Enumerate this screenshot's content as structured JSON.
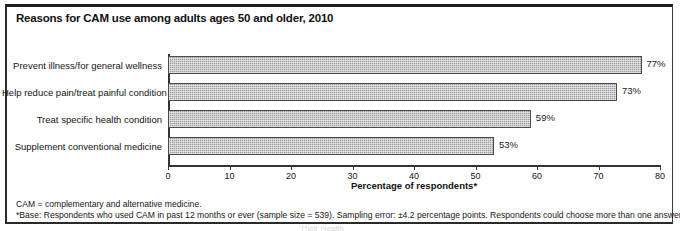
{
  "figure": {
    "title": "Reasons for CAM use among adults ages 50 and older, 2010",
    "footnote_1": "CAM = complementary and alternative medicine.",
    "footnote_2": "*Base: Respondents who used CAM in past 12 months or ever (sample size = 539). Sampling error: ±4.2 percentage points. Respondents could choose more than one answer.",
    "scan_bleed": "Their Health"
  },
  "colors": {
    "bar_fill": "#9d9d9d",
    "bar_border": "#4a4a4a",
    "axis": "#333333",
    "text": "#141414",
    "frame": "#2a2a2a"
  },
  "chart_data": {
    "type": "bar",
    "orientation": "horizontal",
    "title": "Reasons for CAM use among adults ages 50 and older, 2010",
    "categories": [
      "Prevent illness/for general wellness",
      "Help reduce pain/treat painful condition",
      "Treat specific health condition",
      "Supplement conventional medicine"
    ],
    "values": [
      77,
      73,
      59,
      53
    ],
    "value_labels": [
      "77%",
      "73%",
      "59%",
      "53%"
    ],
    "xlabel": "Percentage of respondents*",
    "ylabel": "",
    "xlim": [
      0,
      80
    ],
    "xticks": [
      0,
      10,
      20,
      30,
      40,
      50,
      60,
      70,
      80
    ],
    "xtick_labels": [
      "0",
      "10",
      "20",
      "30",
      "40",
      "50",
      "60",
      "70",
      "80"
    ],
    "grid": false,
    "legend": false
  }
}
